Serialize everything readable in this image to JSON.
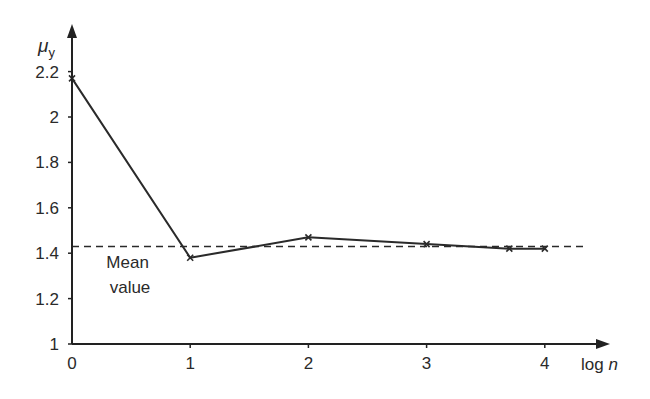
{
  "chart_data": {
    "type": "line",
    "title": "",
    "xlabel": "log n",
    "xlabel_parts": {
      "normal": "log ",
      "italic": "n"
    },
    "ylabel": "μy",
    "ylabel_parts": {
      "main": "μ",
      "sub": "y"
    },
    "xlim": [
      0,
      4.5
    ],
    "ylim": [
      1,
      2.3
    ],
    "x_ticks": [
      0,
      1,
      2,
      3,
      4
    ],
    "x_tick_labels": [
      "0",
      "1",
      "2",
      "3",
      "4"
    ],
    "y_ticks": [
      1,
      1.2,
      1.4,
      1.6,
      1.8,
      2,
      2.2
    ],
    "y_tick_labels": [
      "1",
      "1.2",
      "1.4",
      "1.6",
      "1.8",
      "2",
      "2.2"
    ],
    "grid": false,
    "legend": null,
    "series": [
      {
        "name": "μy",
        "style": "solid",
        "marker": "x",
        "color": "#2a2a2a",
        "x": [
          0,
          1,
          2,
          3,
          3.7,
          4
        ],
        "y": [
          2.17,
          1.38,
          1.47,
          1.44,
          1.42,
          1.42
        ]
      }
    ],
    "reference_lines": [
      {
        "name": "Mean value",
        "orientation": "horizontal",
        "y": 1.43,
        "x_range": [
          0,
          4.4
        ],
        "style": "dashed",
        "color": "#2a2a2a"
      }
    ],
    "annotations": [
      {
        "text_lines": [
          "Mean",
          "value"
        ],
        "x": 0.45,
        "y": 1.35
      }
    ]
  }
}
